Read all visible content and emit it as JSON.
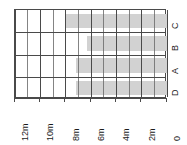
{
  "chart_data": {
    "type": "bar",
    "orientation": "horizontal",
    "title": "",
    "xlabel": "",
    "ylabel": "",
    "categories": [
      "C",
      "B",
      "A",
      "D"
    ],
    "values": [
      8,
      6.3,
      7.2,
      7.2
    ],
    "xlim": [
      12,
      0
    ],
    "x_reversed": true,
    "xticks": [
      12,
      10,
      8,
      6,
      4,
      2,
      0
    ],
    "xticklabels": [
      "12m",
      "10m",
      "8m",
      "6m",
      "4m",
      "2m",
      "0"
    ],
    "minor_gridlines": true,
    "grid": true,
    "legend": "none",
    "bar_color": "#d2d2d2",
    "grid_color": "#6f6f6f",
    "axis_color": "#4a4a4a"
  },
  "axis": {
    "ticks": [
      {
        "label": "12m",
        "value": 12
      },
      {
        "label": "10m",
        "value": 10
      },
      {
        "label": "8m",
        "value": 8
      },
      {
        "label": "6m",
        "value": 6
      },
      {
        "label": "4m",
        "value": 4
      },
      {
        "label": "2m",
        "value": 2
      },
      {
        "label": "0",
        "value": 0
      }
    ]
  },
  "categories": [
    {
      "label": "C",
      "value": 8
    },
    {
      "label": "B",
      "value": 6.3
    },
    {
      "label": "A",
      "value": 7.2
    },
    {
      "label": "D",
      "value": 7.2
    }
  ]
}
